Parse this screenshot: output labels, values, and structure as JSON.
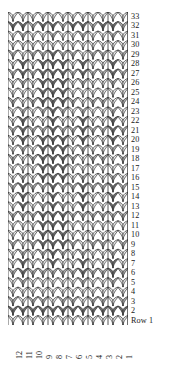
{
  "chart_data": {
    "type": "heatmap",
    "title": "",
    "subtitle": "",
    "xlabel": "",
    "ylabel": "",
    "legend_position": "none",
    "grid": true,
    "chart_kind": "knitting-stitch-chart",
    "columns": 12,
    "rows": 33,
    "x_tick_labels": [
      "12",
      "11",
      "10",
      "9",
      "8",
      "7",
      "6",
      "5",
      "4",
      "3",
      "2",
      "1"
    ],
    "y_tick_labels": [
      "33",
      "32",
      "31",
      "30",
      "29",
      "28",
      "27",
      "26",
      "25",
      "24",
      "23",
      "22",
      "21",
      "20",
      "19",
      "18",
      "17",
      "16",
      "15",
      "14",
      "13",
      "12",
      "11",
      "10",
      "9",
      "8",
      "7",
      "6",
      "5",
      "4",
      "3",
      "2",
      "Row 1"
    ],
    "x_axis_label_order": "right-to-left",
    "y_axis_label_order": "top-to-bottom",
    "value_labels": {
      "1": "light",
      "2": "medium",
      "3": "dark"
    },
    "colors": {
      "light": "#ebebeb",
      "medium": "#b0b0b0",
      "dark": "#6e6e6e",
      "outline": "#2b2b2b",
      "background": "#ffffff",
      "text": "#1a1a1a"
    },
    "values": [
      [
        1,
        1,
        1,
        1,
        1,
        1,
        1,
        1,
        1,
        1,
        1,
        1
      ],
      [
        3,
        3,
        2,
        3,
        3,
        2,
        3,
        3,
        2,
        3,
        3,
        2
      ],
      [
        1,
        2,
        1,
        1,
        2,
        1,
        1,
        2,
        1,
        1,
        2,
        1
      ],
      [
        1,
        1,
        1,
        1,
        1,
        1,
        1,
        1,
        1,
        1,
        1,
        1
      ],
      [
        2,
        1,
        2,
        2,
        3,
        2,
        2,
        1,
        2,
        2,
        1,
        2
      ],
      [
        1,
        3,
        1,
        3,
        3,
        3,
        1,
        3,
        1,
        1,
        3,
        1
      ],
      [
        2,
        3,
        2,
        3,
        3,
        3,
        2,
        3,
        2,
        2,
        3,
        2
      ],
      [
        1,
        2,
        1,
        3,
        3,
        3,
        1,
        2,
        1,
        1,
        2,
        1
      ],
      [
        1,
        1,
        1,
        3,
        3,
        3,
        1,
        1,
        1,
        1,
        1,
        1
      ],
      [
        2,
        1,
        2,
        3,
        3,
        3,
        2,
        1,
        2,
        2,
        1,
        2
      ],
      [
        1,
        2,
        1,
        2,
        3,
        2,
        1,
        2,
        1,
        1,
        2,
        1
      ],
      [
        1,
        3,
        1,
        1,
        3,
        1,
        1,
        3,
        1,
        1,
        3,
        1
      ],
      [
        2,
        3,
        2,
        2,
        3,
        2,
        2,
        3,
        2,
        2,
        3,
        2
      ],
      [
        1,
        3,
        1,
        3,
        3,
        3,
        1,
        3,
        1,
        1,
        3,
        1
      ],
      [
        1,
        2,
        1,
        3,
        3,
        3,
        1,
        2,
        1,
        1,
        2,
        1
      ],
      [
        2,
        1,
        2,
        3,
        3,
        3,
        2,
        1,
        2,
        2,
        1,
        2
      ],
      [
        1,
        1,
        1,
        3,
        3,
        3,
        1,
        1,
        1,
        1,
        1,
        1
      ],
      [
        1,
        2,
        1,
        3,
        3,
        3,
        1,
        2,
        1,
        1,
        2,
        1
      ],
      [
        2,
        3,
        2,
        2,
        3,
        2,
        2,
        3,
        2,
        2,
        3,
        2
      ],
      [
        1,
        3,
        1,
        1,
        3,
        1,
        1,
        3,
        1,
        1,
        3,
        1
      ],
      [
        1,
        3,
        1,
        2,
        3,
        2,
        1,
        3,
        1,
        1,
        3,
        1
      ],
      [
        2,
        2,
        2,
        3,
        3,
        3,
        2,
        2,
        2,
        2,
        2,
        2
      ],
      [
        1,
        1,
        1,
        3,
        3,
        3,
        1,
        1,
        1,
        1,
        1,
        1
      ],
      [
        1,
        1,
        1,
        3,
        3,
        3,
        1,
        1,
        1,
        1,
        1,
        1
      ],
      [
        2,
        1,
        2,
        3,
        3,
        3,
        2,
        1,
        2,
        2,
        1,
        2
      ],
      [
        1,
        2,
        1,
        2,
        3,
        2,
        1,
        2,
        1,
        1,
        2,
        1
      ],
      [
        1,
        3,
        1,
        1,
        3,
        1,
        1,
        3,
        1,
        1,
        3,
        1
      ],
      [
        2,
        3,
        2,
        2,
        2,
        2,
        2,
        3,
        2,
        2,
        3,
        2
      ],
      [
        1,
        2,
        1,
        1,
        1,
        1,
        1,
        2,
        1,
        1,
        2,
        1
      ],
      [
        1,
        1,
        1,
        1,
        1,
        1,
        1,
        1,
        1,
        1,
        1,
        1
      ],
      [
        2,
        1,
        2,
        2,
        1,
        2,
        2,
        1,
        2,
        2,
        1,
        2
      ],
      [
        3,
        3,
        3,
        3,
        3,
        3,
        3,
        3,
        3,
        3,
        3,
        3
      ],
      [
        1,
        1,
        1,
        1,
        1,
        1,
        1,
        1,
        1,
        1,
        1,
        1
      ]
    ]
  }
}
